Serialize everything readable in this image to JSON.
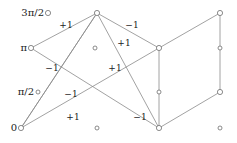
{
  "figure": {
    "width": 237,
    "height": 143,
    "background": "#ffffff",
    "stroke_color": "#8a8a8a",
    "node_stroke": "#6f6f6f",
    "node_fill": "#ffffff",
    "text_color": "#1a1a1a"
  },
  "axis_labels": [
    {
      "name": "y-tick-3pi-over-2",
      "text": "3π/2",
      "x": 44,
      "y": 13
    },
    {
      "name": "y-tick-pi",
      "text": "π",
      "x": 27,
      "y": 48
    },
    {
      "name": "y-tick-pi-over-2",
      "text": "π/2",
      "x": 34,
      "y": 92
    },
    {
      "name": "y-tick-0",
      "text": "0",
      "x": 17,
      "y": 128
    }
  ],
  "nodes": [
    {
      "id": "n0",
      "name": "node-3pi2-left",
      "x": 48,
      "y": 13,
      "r": 2.6,
      "degree": 0
    },
    {
      "id": "n1",
      "name": "node-3pi2-mid",
      "x": 97,
      "y": 13,
      "r": 2.6,
      "degree": 5
    },
    {
      "id": "n2",
      "name": "node-3pi2-right",
      "x": 220,
      "y": 13,
      "r": 2.6,
      "degree": 2
    },
    {
      "id": "n3",
      "name": "node-pi-left",
      "x": 31,
      "y": 48,
      "r": 2.6,
      "degree": 2
    },
    {
      "id": "n4",
      "name": "node-pi-mid",
      "x": 95,
      "y": 48,
      "r": 2.0,
      "degree": 0
    },
    {
      "id": "n5",
      "name": "node-pi-cross",
      "x": 159,
      "y": 48,
      "r": 2.6,
      "degree": 4
    },
    {
      "id": "n6",
      "name": "node-pi-right",
      "x": 220,
      "y": 48,
      "r": 2.0,
      "degree": 0
    },
    {
      "id": "n7",
      "name": "node-pi2-left",
      "x": 38,
      "y": 92,
      "r": 2.0,
      "degree": 0
    },
    {
      "id": "n8",
      "name": "node-pi2-mid",
      "x": 159,
      "y": 92,
      "r": 2.0,
      "degree": 0
    },
    {
      "id": "n9",
      "name": "node-pi2-right",
      "x": 220,
      "y": 92,
      "r": 2.6,
      "degree": 2
    },
    {
      "id": "n10",
      "name": "node-zero-left",
      "x": 21,
      "y": 128,
      "r": 2.6,
      "degree": 3
    },
    {
      "id": "n11",
      "name": "node-zero-mid",
      "x": 97,
      "y": 128,
      "r": 2.0,
      "degree": 0
    },
    {
      "id": "n12",
      "name": "node-zero-cross",
      "x": 159,
      "y": 128,
      "r": 2.6,
      "degree": 4
    },
    {
      "id": "n13",
      "name": "node-zero-right",
      "x": 220,
      "y": 128,
      "r": 2.0,
      "degree": 0
    }
  ],
  "edges": [
    {
      "name": "edge-pi-left-to-3pi2-mid",
      "from": "n3",
      "to": "n1"
    },
    {
      "name": "edge-pi-left-to-zero-cross",
      "from": "n3",
      "to": "n12"
    },
    {
      "name": "edge-3pi2-mid-to-zero-left",
      "from": "n1",
      "to": "n10"
    },
    {
      "name": "edge-3pi2-mid-to-pi-cross",
      "from": "n1",
      "to": "n5"
    },
    {
      "name": "edge-3pi2-mid-to-zero-cross",
      "from": "n1",
      "to": "n12"
    },
    {
      "name": "edge-zero-left-to-pi-cross",
      "from": "n10",
      "to": "n5"
    },
    {
      "name": "edge-zero-left-to-3pi2-mid-b",
      "from": "n10",
      "to": "n1"
    },
    {
      "name": "edge-pi-cross-to-zero-cross",
      "from": "n5",
      "to": "n12"
    },
    {
      "name": "edge-pi-cross-to-3pi2-right",
      "from": "n5",
      "to": "n2"
    },
    {
      "name": "edge-3pi2-right-to-pi2-right",
      "from": "n2",
      "to": "n9"
    },
    {
      "name": "edge-pi2-right-to-zero-cross",
      "from": "n9",
      "to": "n12"
    }
  ],
  "edge_labels": [
    {
      "name": "edge-weight-1",
      "text": "+1",
      "x": 66,
      "y": 25
    },
    {
      "name": "edge-weight-2",
      "text": "−1",
      "x": 132,
      "y": 25
    },
    {
      "name": "edge-weight-3",
      "text": "+1",
      "x": 124,
      "y": 43
    },
    {
      "name": "edge-weight-4",
      "text": "−1",
      "x": 52,
      "y": 68
    },
    {
      "name": "edge-weight-5",
      "text": "+1",
      "x": 115,
      "y": 68
    },
    {
      "name": "edge-weight-6",
      "text": "−1",
      "x": 71,
      "y": 94
    },
    {
      "name": "edge-weight-7",
      "text": "+1",
      "x": 73,
      "y": 117
    },
    {
      "name": "edge-weight-8",
      "text": "−1",
      "x": 140,
      "y": 117
    }
  ]
}
